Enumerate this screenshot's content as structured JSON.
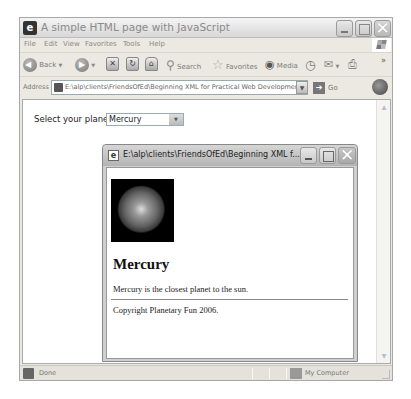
{
  "window": {
    "title": "A simple HTML page with JavaScript",
    "controls": {
      "minimize": "_",
      "maximize": "□",
      "close": "✕"
    }
  },
  "menubar": {
    "items": [
      {
        "label": "File"
      },
      {
        "label": "Edit"
      },
      {
        "label": "View"
      },
      {
        "label": "Favorites"
      },
      {
        "label": "Tools"
      },
      {
        "label": "Help"
      }
    ]
  },
  "toolbar": {
    "back_label": "Back",
    "search_label": "Search",
    "favorites_label": "Favorites",
    "media_label": "Media",
    "chevron": "»",
    "stop_icon": "✕",
    "refresh_icon": "↻",
    "home_icon": "⌂"
  },
  "addressbar": {
    "label": "Address",
    "value": "E:\\alp\\clients\\FriendsOfEd\\Beginning XML for Practical Web Development\\Revised\\C",
    "go_label": "Go"
  },
  "page": {
    "select_label": "Select your planet:",
    "select_value": "Mercury",
    "dropdown_arrow": "▼"
  },
  "popup": {
    "title": "E:\\alp\\clients\\FriendsOfEd\\Beginning XML f...",
    "heading": "Mercury",
    "description": "Mercury is the closest planet to the sun.",
    "copyright": "Copyright Planetary Fun 2006."
  },
  "scrollbar": {
    "up": "▲",
    "down": "▼"
  },
  "statusbar": {
    "status": "Done",
    "zone": "My Computer"
  }
}
